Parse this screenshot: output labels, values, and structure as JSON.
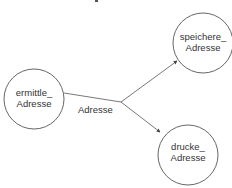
{
  "diagram": {
    "type": "data-flow",
    "colors": {
      "stroke": "#555555",
      "text": "#333333",
      "background": "#ffffff"
    },
    "nodes": [
      {
        "id": "ermittle",
        "line1": "ermittle_",
        "line2": "Adresse",
        "cx": 34,
        "cy": 99,
        "r": 30
      },
      {
        "id": "speichere",
        "line1": "speichere_",
        "line2": "Adresse",
        "cx": 203,
        "cy": 43,
        "r": 30
      },
      {
        "id": "drucke",
        "line1": "drucke_",
        "line2": "Adresse",
        "cx": 188,
        "cy": 155,
        "r": 30
      }
    ],
    "edges": [
      {
        "from": "ermittle",
        "to": "branch",
        "label": "Adresse"
      },
      {
        "from": "branch",
        "to": "speichere"
      },
      {
        "from": "branch",
        "to": "drucke"
      }
    ],
    "edge_label": "Adresse"
  }
}
